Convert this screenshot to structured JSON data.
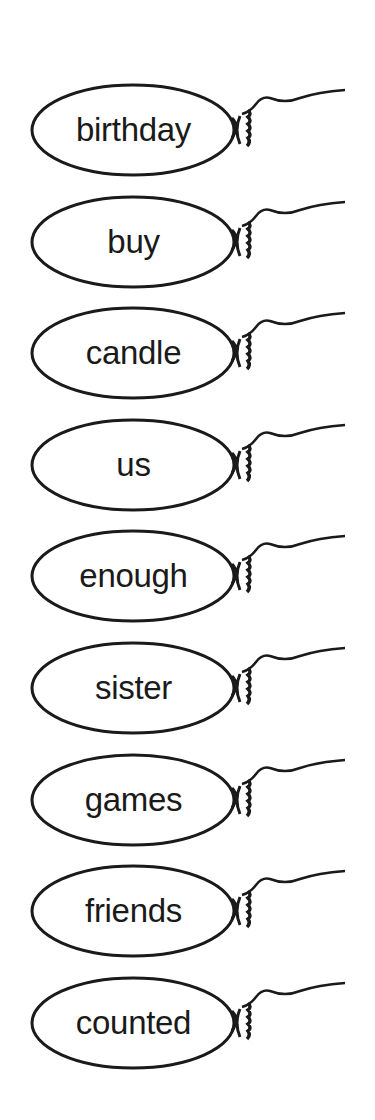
{
  "worksheet": {
    "balloons": [
      {
        "word": "birthday"
      },
      {
        "word": "buy"
      },
      {
        "word": "candle"
      },
      {
        "word": "us"
      },
      {
        "word": "enough"
      },
      {
        "word": "sister"
      },
      {
        "word": "games"
      },
      {
        "word": "friends"
      },
      {
        "word": "counted"
      }
    ]
  },
  "colors": {
    "ink": "#1a1a1a",
    "background": "#ffffff"
  }
}
